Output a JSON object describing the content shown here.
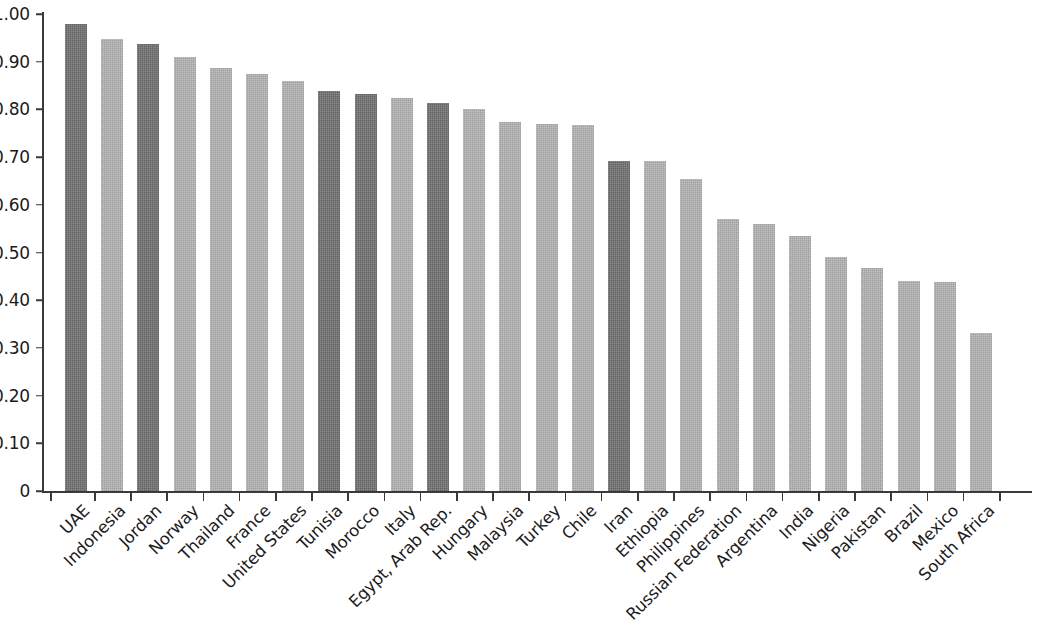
{
  "chart_data": {
    "type": "bar",
    "title": "",
    "subtitle": "",
    "xlabel": "",
    "ylabel": "",
    "ylim": [
      0,
      1.0
    ],
    "grid": false,
    "legend": "none",
    "y_tick_labels": [
      "1.00",
      "0.90",
      "0.80",
      "0.70",
      "0.60",
      "0.50",
      "0.40",
      "0.30",
      "0.20",
      "0.10",
      "0"
    ],
    "y_tick_values": [
      1.0,
      0.9,
      0.8,
      0.7,
      0.6,
      0.5,
      0.4,
      0.3,
      0.2,
      0.1,
      0
    ],
    "categories": [
      "UAE",
      "Indonesia",
      "Jordan",
      "Norway",
      "Thailand",
      "France",
      "United States",
      "Tunisia",
      "Morocco",
      "Italy",
      "Egypt, Arab Rep.",
      "Hungary",
      "Malaysia",
      "Turkey",
      "Chile",
      "Iran",
      "Ethiopia",
      "Philippines",
      "Russian Federation",
      "Argentina",
      "India",
      "Nigeria",
      "Pakistan",
      "Brazil",
      "Mexico",
      "South Africa"
    ],
    "values": [
      0.982,
      0.95,
      0.94,
      0.912,
      0.888,
      0.876,
      0.862,
      0.84,
      0.834,
      0.827,
      0.816,
      0.802,
      0.776,
      0.772,
      0.769,
      0.695,
      0.693,
      0.656,
      0.573,
      0.561,
      0.537,
      0.493,
      0.47,
      0.443,
      0.441,
      0.333
    ],
    "highlighted": [
      "UAE",
      "Jordan",
      "Tunisia",
      "Morocco",
      "Egypt, Arab Rep.",
      "Iran"
    ],
    "colors": {
      "bar_default": "#b1b1b1",
      "bar_highlight": "#6d6d6d",
      "axis": "#3a3a3a",
      "text": "#1b1b1b",
      "background": "#ffffff"
    }
  }
}
